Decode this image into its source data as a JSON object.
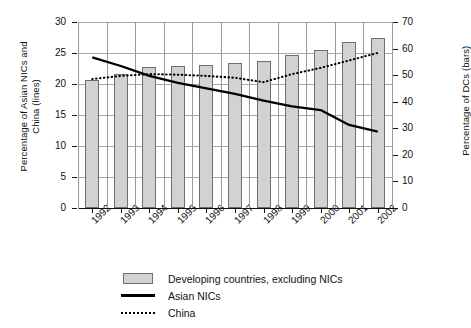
{
  "chart_data": {
    "type": "bar",
    "title": "",
    "xlabel": "",
    "categories": [
      "1992",
      "1993",
      "1994",
      "1995",
      "1996",
      "1997",
      "1998",
      "1999",
      "2000",
      "2001",
      "2002"
    ],
    "grid": true,
    "legend_position": "bottom",
    "axes": {
      "left": {
        "label": "Percentage of Asian NICs and\nChina (lines)",
        "ticks": [
          0,
          5,
          10,
          15,
          20,
          25,
          30
        ],
        "ylim": [
          0,
          30
        ]
      },
      "right": {
        "label": "Percentage of DCs (bars)",
        "ticks": [
          0,
          10,
          20,
          30,
          40,
          50,
          60,
          70
        ],
        "ylim": [
          0,
          70
        ]
      }
    },
    "series": [
      {
        "name": "Developing countries, excluding NICs",
        "type": "bar",
        "axis": "right",
        "values": [
          48.0,
          50.5,
          53.0,
          53.5,
          54.0,
          54.5,
          55.5,
          57.5,
          59.5,
          62.5,
          64.0
        ]
      },
      {
        "name": "Asian NICs",
        "type": "line",
        "style": "solid",
        "axis": "left",
        "values": [
          24.3,
          22.9,
          21.3,
          20.2,
          19.3,
          18.4,
          17.3,
          16.4,
          15.8,
          13.4,
          12.3
        ]
      },
      {
        "name": "China",
        "type": "line",
        "style": "dotted",
        "axis": "left",
        "values": [
          20.8,
          21.3,
          21.6,
          21.5,
          21.3,
          21.0,
          20.3,
          21.6,
          22.6,
          23.8,
          25.0
        ]
      }
    ]
  },
  "legend": {
    "items": [
      {
        "label": "Developing countries, excluding NICs",
        "key": "bar-swatch"
      },
      {
        "label": "Asian NICs",
        "key": "solid-line-swatch"
      },
      {
        "label": "China",
        "key": "dotted-line-swatch"
      }
    ]
  }
}
